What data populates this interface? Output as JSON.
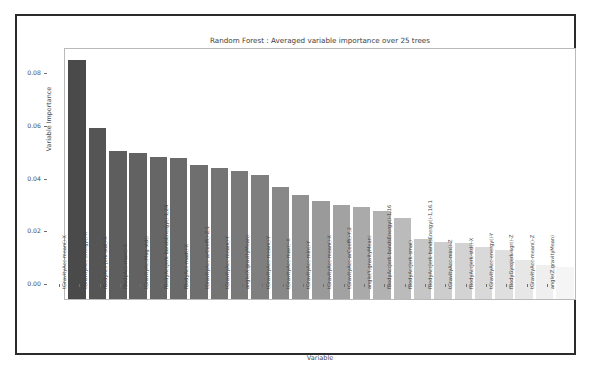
{
  "window": {
    "frame_color": "#2b2b2b",
    "background": "#ffffff"
  },
  "axis": {
    "y_label": "Variable Importance",
    "x_label": "Variable",
    "y_ticks": [
      "0.00",
      "0.02",
      "0.04",
      "0.06",
      "0.08"
    ]
  },
  "chart_data": {
    "type": "bar",
    "title": "Random Forest : Averaged variable importance over 25 trees",
    "xlabel": "Variable",
    "ylabel": "Variable Importance",
    "ylim": [
      0.0,
      0.095
    ],
    "yticks": [
      0.0,
      0.02,
      0.04,
      0.06,
      0.08
    ],
    "grid": false,
    "legend": "none",
    "orientation": "vertical",
    "bar_color_scale": "grey gradient, dark (high importance) to light (low importance)",
    "categories": [
      "tGravityAcc-mean()-X",
      "tGravityAcc-energy()-X",
      "fBodyAcc-jerk-std()-X",
      "fBodyAcc-max()-X",
      "tGravityAccMag-std()",
      "fBodyAccJerk-bandsEnergy()-1,24",
      "fBodyAcc-mad()-X",
      "tGravityAcc-arCoeff()-Z,1",
      "tGravityAcc-mean()-Y",
      "angle(X,gravityMean)",
      "tGravityAcc-mean()-Y",
      "tGravityAcc-max()-X",
      "tGravityAcc-min()-Y",
      "tGravityAcc-mean()-X",
      "tGravityAcc-arCoeff()-Y,2",
      "angle(Y,gravityMean)",
      "fBodyAccJerk-bandsEnergy()-1,16",
      "fBodyAccJerk-sma()",
      "fBodyAccJerk-bandsEnergy()-1,16.1",
      "tGravityAcc-min()-Z",
      "fBodyAccJerk-std()-X",
      "tGravityAcc-energy()-Y",
      "fBodyGyroJerk-sgr()-Z",
      "tGravityAcc-mean()-Z",
      "angle(Z,gravityMean)"
    ],
    "values": [
      0.0908,
      0.0648,
      0.0561,
      0.0554,
      0.0538,
      0.0535,
      0.0511,
      0.0496,
      0.0487,
      0.0472,
      0.0424,
      0.0396,
      0.0373,
      0.0359,
      0.0348,
      0.0334,
      0.0308,
      0.0228,
      0.0218,
      0.0211,
      0.0196,
      0.0188,
      0.0149,
      0.013,
      0.0122
    ],
    "bar_colors": [
      "#4a4a4a",
      "#555555",
      "#5e5e5e",
      "#626262",
      "#666666",
      "#6a6a6a",
      "#6f6f6f",
      "#747474",
      "#797979",
      "#7f7f7f",
      "#888888",
      "#919191",
      "#9a9a9a",
      "#a2a2a2",
      "#aaaaaa",
      "#b2b2b2",
      "#bbbbbb",
      "#c6c6c6",
      "#cdcdcd",
      "#d3d3d3",
      "#d9d9d9",
      "#dfdfdf",
      "#e7e7e7",
      "#efefef",
      "#f5f5f5"
    ]
  }
}
